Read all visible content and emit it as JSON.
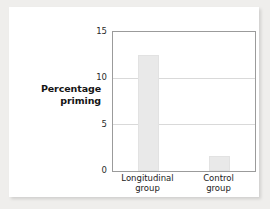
{
  "chart_data": {
    "type": "bar",
    "title": "",
    "subtitle": "",
    "categories": [
      "Longitudinal group",
      "Control group"
    ],
    "category_lines": [
      [
        "Longitudinal",
        "group"
      ],
      [
        "Control",
        "group"
      ]
    ],
    "values": [
      12.5,
      1.6
    ],
    "xlabel": "",
    "ylabel": "Percentage priming",
    "ylabel_lines": [
      "Percentage",
      "priming"
    ],
    "ylim": [
      0,
      15
    ],
    "yticks": [
      0,
      5,
      10,
      15
    ],
    "ytick_labels": [
      "0",
      "5",
      "10",
      "15"
    ],
    "grid": "horizontal",
    "gridlines_at": [
      5,
      10
    ],
    "legend": null,
    "legend_position": "none",
    "annotations": [],
    "colors": {
      "bar_fill": "#e9e9e9",
      "bar_edge": "#e2e2e2",
      "axis_frame": "#9b9b9b",
      "gridline": "#d9d9d9",
      "text": "#222222",
      "card_background": "#ffffff",
      "page_background": "#efeeec"
    }
  }
}
